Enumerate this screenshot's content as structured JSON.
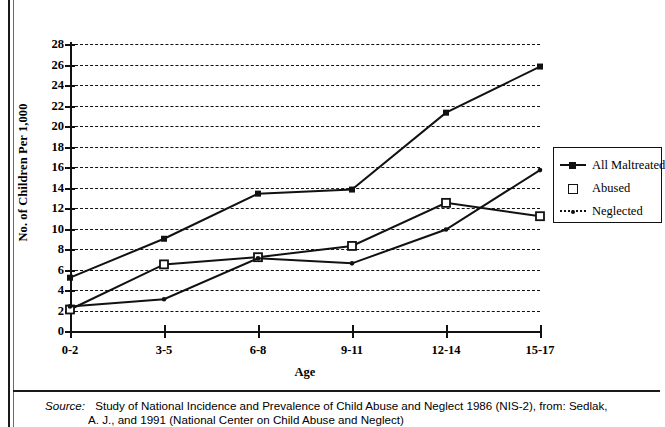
{
  "chart_data": {
    "type": "line",
    "title": "",
    "xlabel": "Age",
    "ylabel": "No. of Children Per 1,000",
    "categories": [
      "0-2",
      "3-5",
      "6-8",
      "9-11",
      "12-14",
      "15-17"
    ],
    "ylim": [
      0,
      28
    ],
    "ytick_step": 2,
    "yticks": [
      28,
      26,
      24,
      22,
      20,
      18,
      16,
      14,
      12,
      10,
      8,
      6,
      4,
      2,
      0
    ],
    "grid": "horizontal-dashed",
    "legend_position": "right",
    "series": [
      {
        "name": "All Maltreated",
        "marker": "filled-square",
        "line": "solid",
        "values": [
          5.2,
          9.0,
          13.4,
          13.8,
          21.3,
          25.8
        ]
      },
      {
        "name": "Abused",
        "marker": "open-square",
        "line": "solid",
        "values": [
          2.1,
          6.5,
          7.2,
          8.3,
          12.5,
          11.2
        ]
      },
      {
        "name": "Neglected",
        "marker": "small-dot",
        "line": "dotted",
        "values": [
          2.4,
          3.1,
          7.1,
          6.6,
          9.9,
          15.7
        ]
      }
    ]
  },
  "legend": {
    "items": [
      {
        "label": "All Maltreated"
      },
      {
        "label": "Abused"
      },
      {
        "label": "Neglected"
      }
    ]
  },
  "source": {
    "label": "Source:",
    "line1": "Study of National Incidence and Prevalence of Child Abuse and Neglect 1986 (NIS-2), from: Sedlak,",
    "line2": "A. J., and 1991 (National Center on Child Abuse and Neglect)"
  },
  "colors": {
    "ink": "#111111",
    "background": "#ffffff"
  }
}
